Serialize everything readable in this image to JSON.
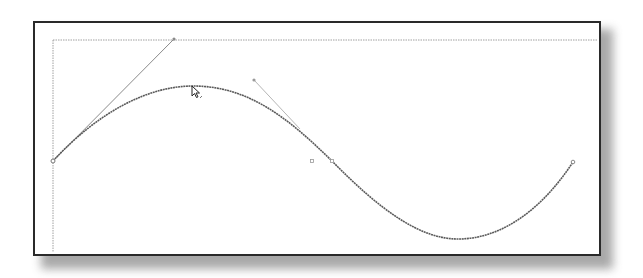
{
  "canvas": {
    "frame_color": "#2a2a2a",
    "guide_color": "#9a9a9a",
    "curve_color": "#555555",
    "handle_color": "#8a8a8a",
    "background": "#ffffff"
  },
  "bezier": {
    "anchors": [
      {
        "x": 53,
        "y": 161
      },
      {
        "x": 332,
        "y": 161
      },
      {
        "x": 573,
        "y": 162
      }
    ],
    "handles": [
      {
        "from": {
          "x": 53,
          "y": 161
        },
        "to": {
          "x": 174,
          "y": 39
        }
      },
      {
        "from": {
          "x": 297,
          "y": 126
        },
        "to": {
          "x": 254,
          "y": 80
        }
      }
    ],
    "midpoint_marker": {
      "x": 312,
      "y": 161
    }
  },
  "cursor": {
    "type": "direct-selection-arrow",
    "x": 192,
    "y": 87
  }
}
